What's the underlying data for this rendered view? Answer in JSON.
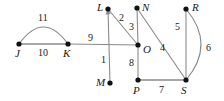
{
  "figure": {
    "type": "weighted-graph-diagram",
    "background_color": "#ffffff",
    "edge_color": "#8a8a8a",
    "vertex_color": "#111111",
    "label_color": "#1a1a1a",
    "width": 224,
    "height": 101
  },
  "vertices": [
    {
      "id": "J",
      "label": "J",
      "x": 19,
      "y": 44,
      "label_x": 15,
      "label_y": 48
    },
    {
      "id": "K",
      "label": "K",
      "x": 68,
      "y": 44,
      "label_x": 63,
      "label_y": 48
    },
    {
      "id": "L",
      "label": "L",
      "x": 108,
      "y": 9,
      "label_x": 97,
      "label_y": 2
    },
    {
      "id": "M",
      "label": "M",
      "x": 110,
      "y": 83,
      "label_x": 96,
      "label_y": 77
    },
    {
      "id": "N",
      "label": "N",
      "x": 137,
      "y": 8,
      "label_x": 142,
      "label_y": 2
    },
    {
      "id": "O",
      "label": "O",
      "x": 138,
      "y": 45,
      "label_x": 143,
      "label_y": 44
    },
    {
      "id": "P",
      "label": "P",
      "x": 138,
      "y": 80,
      "label_x": 133,
      "label_y": 85
    },
    {
      "id": "R",
      "label": "R",
      "x": 186,
      "y": 9,
      "label_x": 192,
      "label_y": 2
    },
    {
      "id": "S",
      "label": "S",
      "x": 186,
      "y": 80,
      "label_x": 181,
      "label_y": 85
    }
  ],
  "edges": [
    {
      "id": "JK-arc",
      "from": "J",
      "to": "K",
      "weight": "11",
      "shape": "arc",
      "label_x": 38,
      "label_y": 13,
      "arrow": false
    },
    {
      "id": "JK-line",
      "from": "J",
      "to": "K",
      "weight": "10",
      "shape": "straight",
      "label_x": 38,
      "label_y": 48,
      "arrow": false
    },
    {
      "id": "KO",
      "from": "K",
      "to": "O",
      "weight": "9",
      "shape": "straight",
      "label_x": 88,
      "label_y": 33,
      "arrow": false
    },
    {
      "id": "LO",
      "from": "L",
      "to": "O",
      "weight": "2",
      "shape": "straight",
      "label_x": 119,
      "label_y": 13,
      "arrow": false
    },
    {
      "id": "LM",
      "from": "M",
      "to": "L",
      "weight": "1",
      "shape": "straight",
      "label_x": 101,
      "label_y": 55,
      "arrow": true
    },
    {
      "id": "NO",
      "from": "N",
      "to": "O",
      "weight": "3",
      "shape": "straight",
      "label_x": 129,
      "label_y": 22,
      "arrow": false
    },
    {
      "id": "NS",
      "from": "N",
      "to": "S",
      "weight": "4",
      "shape": "straight",
      "label_x": 160,
      "label_y": 43,
      "arrow": false
    },
    {
      "id": "OP",
      "from": "O",
      "to": "P",
      "weight": "8",
      "shape": "straight",
      "label_x": 129,
      "label_y": 58,
      "arrow": false
    },
    {
      "id": "PS",
      "from": "P",
      "to": "S",
      "weight": "7",
      "shape": "straight",
      "label_x": 159,
      "label_y": 85,
      "arrow": false
    },
    {
      "id": "RS-line",
      "from": "R",
      "to": "S",
      "weight": "5",
      "shape": "straight",
      "label_x": 175,
      "label_y": 22,
      "arrow": false
    },
    {
      "id": "RS-arc",
      "from": "R",
      "to": "S",
      "weight": "6",
      "shape": "arc",
      "label_x": 206,
      "label_y": 43,
      "arrow": false
    }
  ],
  "arc_paths": {
    "JK": "M 19 44 Q 43.5 10 68 44",
    "RS": "M 186 9 Q 216 44.5 186 80"
  }
}
